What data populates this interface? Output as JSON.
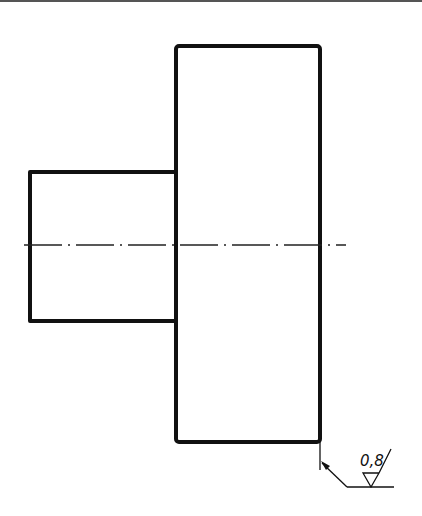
{
  "drawing": {
    "type": "technical-drawing",
    "view": "shaft-step-side-view",
    "colors": {
      "line": "#111111",
      "background": "#ffffff"
    },
    "large_rect": {
      "x": 176,
      "y": 46,
      "w": 144,
      "h": 396
    },
    "small_rect": {
      "x": 29,
      "y": 172,
      "w": 147,
      "h": 149
    },
    "centerline": {
      "y": 245,
      "x1": 24,
      "x2": 346,
      "style": "dash-dot"
    },
    "surface_finish": {
      "symbol": "roughness-triangle-with-leader",
      "value": "0,8"
    }
  }
}
